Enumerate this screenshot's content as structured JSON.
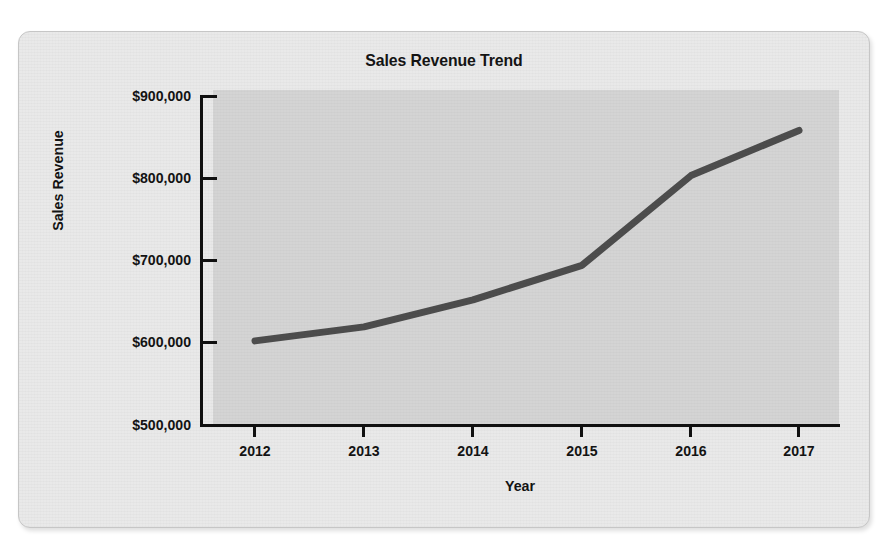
{
  "figure": {
    "title": "Sales Revenue Trend",
    "frame_color": "#e9e9e9",
    "plot_bg_color": "#d4d4d4",
    "line_color": "#4d4d4d",
    "axis_color": "#101010",
    "text_color": "#131313"
  },
  "chart_data": {
    "type": "line",
    "title": "Sales Revenue Trend",
    "xlabel": "Year",
    "ylabel": "Sales Revenue",
    "categories": [
      "2012",
      "2013",
      "2014",
      "2015",
      "2016",
      "2017"
    ],
    "x": [
      2012,
      2013,
      2014,
      2015,
      2016,
      2017
    ],
    "values": [
      601000,
      618000,
      651000,
      693000,
      802000,
      857000
    ],
    "series": [
      {
        "name": "Sales Revenue",
        "values": [
          601000,
          618000,
          651000,
          693000,
          802000,
          857000
        ]
      }
    ],
    "ylim": [
      500000,
      900000
    ],
    "ytick_values": [
      900000,
      800000,
      700000,
      600000,
      500000
    ],
    "ytick_labels": [
      "$900,000",
      "$800,000",
      "$700,000",
      "$600,000",
      "$500,000"
    ],
    "xtick_labels": [
      "2012",
      "2013",
      "2014",
      "2015",
      "2016",
      "2017"
    ],
    "grid": false,
    "legend": false,
    "legend_position": "none",
    "markers": false,
    "line_width_px": 7,
    "annotations": []
  }
}
